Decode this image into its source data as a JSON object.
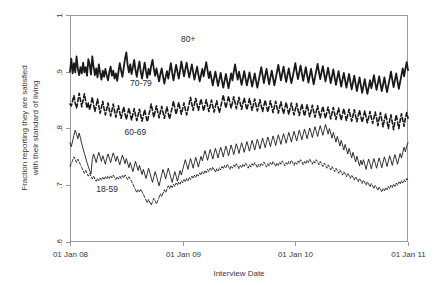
{
  "chart_data": {
    "type": "line",
    "title": "",
    "xlabel": "Interview Date",
    "ylabel": "Fraction reporting they are satisfied with their standard of living",
    "ylabel_line1": "Fraction reporting they are satisfied",
    "ylabel_line2": "with their standard of living",
    "xlim": [
      2008.0,
      2011.0
    ],
    "ylim": [
      0.6,
      1.0
    ],
    "grid": false,
    "legend_position": "inline-annotations",
    "xtick_labels": [
      "01 Jan 08",
      "01 Jan 09",
      "01 Jan 10",
      "01 Jan 11"
    ],
    "xtick_values": [
      2008.0,
      2009.0,
      2010.0,
      2011.0
    ],
    "ytick_labels": [
      "1",
      ".9",
      ".8",
      ".7",
      ".6"
    ],
    "ytick_values": [
      1.0,
      0.9,
      0.8,
      0.7,
      0.6
    ],
    "annotations": [
      {
        "text": "80+",
        "x": 2009.05,
        "y": 0.953
      },
      {
        "text": "70-79",
        "x": 2008.63,
        "y": 0.875
      },
      {
        "text": "60-69",
        "x": 2008.58,
        "y": 0.788
      },
      {
        "text": "18-59",
        "x": 2008.33,
        "y": 0.688
      }
    ],
    "series": [
      {
        "name": "80+",
        "style": "solid",
        "width": 1.8,
        "color": "#111111",
        "values": [
          0.9,
          0.923,
          0.897,
          0.915,
          0.899,
          0.927,
          0.905,
          0.894,
          0.908,
          0.897,
          0.916,
          0.899,
          0.908,
          0.893,
          0.922,
          0.913,
          0.895,
          0.927,
          0.909,
          0.894,
          0.906,
          0.89,
          0.913,
          0.898,
          0.886,
          0.902,
          0.891,
          0.905,
          0.894,
          0.885,
          0.899,
          0.909,
          0.893,
          0.902,
          0.888,
          0.897,
          0.884,
          0.9,
          0.915,
          0.902,
          0.891,
          0.907,
          0.923,
          0.934,
          0.912,
          0.899,
          0.913,
          0.896,
          0.908,
          0.921,
          0.903,
          0.891,
          0.906,
          0.918,
          0.9,
          0.888,
          0.903,
          0.916,
          0.901,
          0.889,
          0.905,
          0.895,
          0.911,
          0.921,
          0.905,
          0.893,
          0.906,
          0.894,
          0.883,
          0.896,
          0.906,
          0.892,
          0.879,
          0.891,
          0.901,
          0.888,
          0.902,
          0.915,
          0.898,
          0.885,
          0.899,
          0.912,
          0.9,
          0.888,
          0.902,
          0.918,
          0.905,
          0.892,
          0.904,
          0.916,
          0.903,
          0.89,
          0.901,
          0.913,
          0.899,
          0.886,
          0.898,
          0.909,
          0.895,
          0.883,
          0.894,
          0.905,
          0.892,
          0.905,
          0.917,
          0.902,
          0.889,
          0.9,
          0.888,
          0.876,
          0.889,
          0.9,
          0.887,
          0.875,
          0.886,
          0.898,
          0.884,
          0.872,
          0.884,
          0.896,
          0.883,
          0.871,
          0.884,
          0.897,
          0.885,
          0.9,
          0.913,
          0.898,
          0.886,
          0.9,
          0.889,
          0.877,
          0.889,
          0.901,
          0.888,
          0.876,
          0.887,
          0.899,
          0.886,
          0.874,
          0.885,
          0.897,
          0.884,
          0.872,
          0.884,
          0.896,
          0.908,
          0.894,
          0.88,
          0.893,
          0.905,
          0.891,
          0.878,
          0.89,
          0.902,
          0.889,
          0.876,
          0.888,
          0.9,
          0.912,
          0.898,
          0.885,
          0.897,
          0.909,
          0.895,
          0.882,
          0.894,
          0.906,
          0.892,
          0.88,
          0.891,
          0.903,
          0.915,
          0.9,
          0.887,
          0.899,
          0.911,
          0.897,
          0.884,
          0.896,
          0.908,
          0.894,
          0.881,
          0.893,
          0.905,
          0.891,
          0.878,
          0.89,
          0.902,
          0.914,
          0.9,
          0.887,
          0.899,
          0.91,
          0.896,
          0.883,
          0.895,
          0.907,
          0.893,
          0.88,
          0.892,
          0.904,
          0.89,
          0.877,
          0.889,
          0.901,
          0.887,
          0.874,
          0.886,
          0.898,
          0.885,
          0.872,
          0.884,
          0.896,
          0.882,
          0.869,
          0.881,
          0.893,
          0.879,
          0.866,
          0.878,
          0.89,
          0.876,
          0.863,
          0.875,
          0.887,
          0.873,
          0.861,
          0.873,
          0.885,
          0.871,
          0.882,
          0.894,
          0.88,
          0.868,
          0.88,
          0.892,
          0.878,
          0.866,
          0.878,
          0.89,
          0.876,
          0.864,
          0.876,
          0.888,
          0.9,
          0.886,
          0.873,
          0.885,
          0.897,
          0.883,
          0.87,
          0.882,
          0.894,
          0.906,
          0.892,
          0.905,
          0.917,
          0.903
        ]
      },
      {
        "name": "70-79",
        "style": "dashed",
        "width": 1.6,
        "color": "#111111",
        "values": [
          0.843,
          0.84,
          0.849,
          0.858,
          0.845,
          0.836,
          0.848,
          0.862,
          0.85,
          0.838,
          0.85,
          0.861,
          0.848,
          0.836,
          0.845,
          0.833,
          0.843,
          0.855,
          0.842,
          0.83,
          0.84,
          0.852,
          0.839,
          0.827,
          0.837,
          0.848,
          0.835,
          0.824,
          0.834,
          0.845,
          0.833,
          0.822,
          0.832,
          0.843,
          0.831,
          0.82,
          0.83,
          0.84,
          0.828,
          0.818,
          0.828,
          0.838,
          0.826,
          0.816,
          0.826,
          0.836,
          0.825,
          0.815,
          0.825,
          0.835,
          0.824,
          0.814,
          0.824,
          0.834,
          0.823,
          0.813,
          0.823,
          0.833,
          0.822,
          0.812,
          0.822,
          0.832,
          0.843,
          0.831,
          0.82,
          0.83,
          0.84,
          0.829,
          0.819,
          0.829,
          0.839,
          0.828,
          0.818,
          0.828,
          0.838,
          0.827,
          0.817,
          0.827,
          0.837,
          0.848,
          0.836,
          0.825,
          0.836,
          0.846,
          0.835,
          0.825,
          0.835,
          0.845,
          0.834,
          0.824,
          0.834,
          0.844,
          0.855,
          0.843,
          0.832,
          0.843,
          0.853,
          0.842,
          0.832,
          0.842,
          0.852,
          0.841,
          0.831,
          0.841,
          0.851,
          0.84,
          0.83,
          0.84,
          0.85,
          0.839,
          0.829,
          0.839,
          0.849,
          0.838,
          0.828,
          0.838,
          0.848,
          0.859,
          0.847,
          0.836,
          0.847,
          0.857,
          0.846,
          0.836,
          0.846,
          0.856,
          0.845,
          0.835,
          0.845,
          0.855,
          0.844,
          0.834,
          0.844,
          0.854,
          0.843,
          0.833,
          0.843,
          0.853,
          0.842,
          0.832,
          0.842,
          0.852,
          0.841,
          0.831,
          0.841,
          0.851,
          0.84,
          0.83,
          0.84,
          0.85,
          0.839,
          0.829,
          0.839,
          0.849,
          0.838,
          0.828,
          0.838,
          0.848,
          0.837,
          0.827,
          0.837,
          0.847,
          0.836,
          0.826,
          0.836,
          0.846,
          0.835,
          0.825,
          0.835,
          0.845,
          0.834,
          0.824,
          0.834,
          0.844,
          0.833,
          0.823,
          0.833,
          0.843,
          0.832,
          0.822,
          0.832,
          0.842,
          0.831,
          0.821,
          0.831,
          0.841,
          0.83,
          0.82,
          0.83,
          0.84,
          0.829,
          0.819,
          0.829,
          0.839,
          0.828,
          0.818,
          0.828,
          0.838,
          0.827,
          0.817,
          0.827,
          0.837,
          0.826,
          0.816,
          0.826,
          0.836,
          0.825,
          0.815,
          0.825,
          0.835,
          0.824,
          0.814,
          0.824,
          0.834,
          0.823,
          0.813,
          0.823,
          0.833,
          0.822,
          0.812,
          0.822,
          0.832,
          0.821,
          0.811,
          0.821,
          0.831,
          0.82,
          0.81,
          0.82,
          0.83,
          0.819,
          0.809,
          0.819,
          0.829,
          0.818,
          0.805,
          0.818,
          0.828,
          0.815,
          0.803,
          0.816,
          0.826,
          0.813,
          0.8,
          0.814,
          0.824,
          0.811,
          0.798,
          0.812,
          0.824,
          0.812,
          0.8,
          0.814,
          0.826,
          0.815,
          0.804,
          0.818,
          0.828,
          0.818
        ]
      },
      {
        "name": "60-69",
        "style": "solid",
        "width": 0.9,
        "color": "#111111",
        "values": [
          0.775,
          0.768,
          0.778,
          0.788,
          0.797,
          0.79,
          0.782,
          0.792,
          0.783,
          0.773,
          0.764,
          0.756,
          0.748,
          0.74,
          0.733,
          0.726,
          0.72,
          0.745,
          0.755,
          0.748,
          0.74,
          0.75,
          0.758,
          0.75,
          0.742,
          0.752,
          0.745,
          0.737,
          0.747,
          0.755,
          0.748,
          0.74,
          0.749,
          0.757,
          0.75,
          0.742,
          0.751,
          0.744,
          0.736,
          0.745,
          0.753,
          0.746,
          0.738,
          0.747,
          0.739,
          0.731,
          0.74,
          0.732,
          0.724,
          0.733,
          0.742,
          0.734,
          0.726,
          0.735,
          0.727,
          0.719,
          0.728,
          0.72,
          0.712,
          0.721,
          0.73,
          0.722,
          0.713,
          0.705,
          0.715,
          0.724,
          0.716,
          0.707,
          0.699,
          0.709,
          0.719,
          0.728,
          0.72,
          0.711,
          0.721,
          0.73,
          0.722,
          0.713,
          0.705,
          0.715,
          0.724,
          0.716,
          0.707,
          0.717,
          0.726,
          0.718,
          0.727,
          0.736,
          0.745,
          0.737,
          0.728,
          0.738,
          0.747,
          0.739,
          0.73,
          0.74,
          0.749,
          0.741,
          0.732,
          0.742,
          0.751,
          0.743,
          0.752,
          0.761,
          0.753,
          0.744,
          0.754,
          0.763,
          0.755,
          0.746,
          0.756,
          0.765,
          0.757,
          0.748,
          0.758,
          0.767,
          0.759,
          0.75,
          0.76,
          0.769,
          0.761,
          0.752,
          0.762,
          0.771,
          0.763,
          0.754,
          0.764,
          0.773,
          0.765,
          0.756,
          0.766,
          0.775,
          0.767,
          0.758,
          0.768,
          0.777,
          0.769,
          0.76,
          0.77,
          0.779,
          0.771,
          0.762,
          0.772,
          0.781,
          0.773,
          0.764,
          0.774,
          0.783,
          0.775,
          0.766,
          0.776,
          0.785,
          0.777,
          0.768,
          0.778,
          0.787,
          0.779,
          0.77,
          0.78,
          0.789,
          0.781,
          0.772,
          0.782,
          0.791,
          0.783,
          0.774,
          0.784,
          0.793,
          0.785,
          0.776,
          0.786,
          0.795,
          0.787,
          0.778,
          0.788,
          0.797,
          0.789,
          0.78,
          0.79,
          0.799,
          0.791,
          0.782,
          0.792,
          0.801,
          0.793,
          0.784,
          0.794,
          0.803,
          0.795,
          0.786,
          0.796,
          0.805,
          0.797,
          0.788,
          0.798,
          0.807,
          0.799,
          0.79,
          0.8,
          0.792,
          0.783,
          0.793,
          0.785,
          0.776,
          0.786,
          0.778,
          0.769,
          0.779,
          0.771,
          0.762,
          0.772,
          0.764,
          0.755,
          0.765,
          0.757,
          0.748,
          0.758,
          0.75,
          0.741,
          0.751,
          0.743,
          0.734,
          0.744,
          0.736,
          0.745,
          0.737,
          0.728,
          0.738,
          0.746,
          0.738,
          0.729,
          0.739,
          0.747,
          0.739,
          0.73,
          0.74,
          0.748,
          0.74,
          0.731,
          0.741,
          0.75,
          0.742,
          0.733,
          0.743,
          0.752,
          0.744,
          0.735,
          0.745,
          0.754,
          0.746,
          0.737,
          0.747,
          0.756,
          0.748,
          0.758,
          0.767,
          0.759,
          0.769,
          0.775
        ]
      },
      {
        "name": "18-59",
        "style": "dashed-thin",
        "width": 0.9,
        "color": "#222222",
        "values": [
          0.733,
          0.738,
          0.744,
          0.75,
          0.745,
          0.74,
          0.746,
          0.741,
          0.736,
          0.731,
          0.726,
          0.721,
          0.726,
          0.721,
          0.716,
          0.721,
          0.716,
          0.711,
          0.716,
          0.711,
          0.707,
          0.712,
          0.708,
          0.713,
          0.709,
          0.714,
          0.71,
          0.715,
          0.711,
          0.716,
          0.712,
          0.717,
          0.713,
          0.718,
          0.714,
          0.71,
          0.715,
          0.711,
          0.716,
          0.712,
          0.717,
          0.713,
          0.718,
          0.714,
          0.71,
          0.715,
          0.711,
          0.707,
          0.702,
          0.697,
          0.692,
          0.687,
          0.692,
          0.688,
          0.693,
          0.689,
          0.684,
          0.679,
          0.674,
          0.669,
          0.675,
          0.67,
          0.665,
          0.671,
          0.677,
          0.672,
          0.667,
          0.673,
          0.679,
          0.685,
          0.68,
          0.686,
          0.692,
          0.687,
          0.693,
          0.699,
          0.694,
          0.7,
          0.696,
          0.702,
          0.698,
          0.704,
          0.7,
          0.706,
          0.702,
          0.708,
          0.704,
          0.71,
          0.706,
          0.712,
          0.708,
          0.714,
          0.71,
          0.716,
          0.712,
          0.718,
          0.714,
          0.72,
          0.716,
          0.722,
          0.718,
          0.724,
          0.72,
          0.726,
          0.722,
          0.728,
          0.724,
          0.73,
          0.726,
          0.732,
          0.728,
          0.723,
          0.729,
          0.725,
          0.731,
          0.727,
          0.733,
          0.729,
          0.735,
          0.731,
          0.737,
          0.733,
          0.728,
          0.734,
          0.73,
          0.736,
          0.732,
          0.738,
          0.734,
          0.729,
          0.735,
          0.731,
          0.737,
          0.733,
          0.739,
          0.735,
          0.73,
          0.736,
          0.732,
          0.738,
          0.734,
          0.74,
          0.736,
          0.731,
          0.737,
          0.733,
          0.739,
          0.735,
          0.741,
          0.737,
          0.732,
          0.738,
          0.734,
          0.74,
          0.736,
          0.742,
          0.738,
          0.733,
          0.739,
          0.735,
          0.741,
          0.737,
          0.743,
          0.739,
          0.734,
          0.74,
          0.736,
          0.742,
          0.738,
          0.744,
          0.74,
          0.735,
          0.741,
          0.737,
          0.743,
          0.739,
          0.745,
          0.741,
          0.736,
          0.742,
          0.738,
          0.744,
          0.74,
          0.746,
          0.742,
          0.737,
          0.743,
          0.739,
          0.745,
          0.741,
          0.736,
          0.742,
          0.738,
          0.733,
          0.739,
          0.735,
          0.73,
          0.736,
          0.732,
          0.727,
          0.733,
          0.729,
          0.724,
          0.73,
          0.726,
          0.721,
          0.727,
          0.723,
          0.718,
          0.724,
          0.72,
          0.715,
          0.721,
          0.717,
          0.712,
          0.718,
          0.714,
          0.709,
          0.715,
          0.711,
          0.706,
          0.712,
          0.708,
          0.703,
          0.709,
          0.705,
          0.7,
          0.706,
          0.702,
          0.697,
          0.703,
          0.699,
          0.694,
          0.7,
          0.696,
          0.691,
          0.697,
          0.693,
          0.688,
          0.694,
          0.69,
          0.696,
          0.692,
          0.698,
          0.694,
          0.7,
          0.696,
          0.702,
          0.698,
          0.704,
          0.7,
          0.706,
          0.702,
          0.708,
          0.704,
          0.71,
          0.706,
          0.712,
          0.708
        ]
      }
    ]
  },
  "plot_geometry": {
    "left": 70,
    "right": 408,
    "top": 15,
    "bottom": 242
  }
}
